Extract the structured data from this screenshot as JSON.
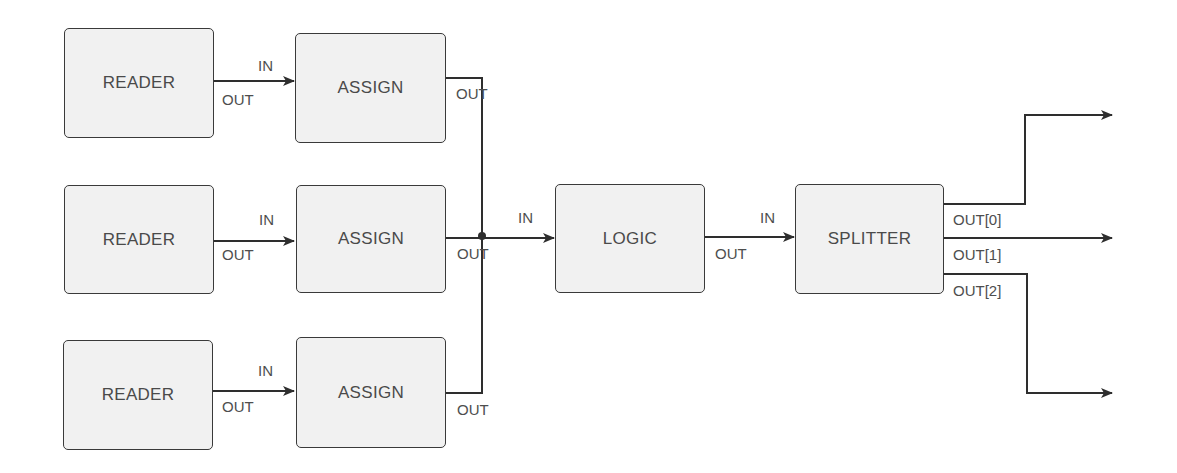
{
  "diagram": {
    "type": "block-dataflow",
    "colors": {
      "box_fill": "#f1f1f1",
      "box_border": "#3a3a3a",
      "line": "#2e2e2e",
      "text": "#4a4a4a"
    },
    "nodes": [
      {
        "id": "reader1",
        "label": "READER"
      },
      {
        "id": "reader2",
        "label": "READER"
      },
      {
        "id": "reader3",
        "label": "READER"
      },
      {
        "id": "assign1",
        "label": "ASSIGN"
      },
      {
        "id": "assign2",
        "label": "ASSIGN"
      },
      {
        "id": "assign3",
        "label": "ASSIGN"
      },
      {
        "id": "logic",
        "label": "LOGIC"
      },
      {
        "id": "splitter",
        "label": "SPLITTER"
      }
    ],
    "port_labels": {
      "in": "IN",
      "out": "OUT",
      "out0": "OUT[0]",
      "out1": "OUT[1]",
      "out2": "OUT[2]"
    },
    "edges": [
      {
        "from": "reader1.OUT",
        "to": "assign1.IN"
      },
      {
        "from": "reader2.OUT",
        "to": "assign2.IN"
      },
      {
        "from": "reader3.OUT",
        "to": "assign3.IN"
      },
      {
        "from": "assign1.OUT",
        "to": "logic.IN"
      },
      {
        "from": "assign2.OUT",
        "to": "logic.IN"
      },
      {
        "from": "assign3.OUT",
        "to": "logic.IN"
      },
      {
        "from": "logic.OUT",
        "to": "splitter.IN"
      },
      {
        "from": "splitter.OUT[0]",
        "to": "external"
      },
      {
        "from": "splitter.OUT[1]",
        "to": "external"
      },
      {
        "from": "splitter.OUT[2]",
        "to": "external"
      }
    ]
  }
}
